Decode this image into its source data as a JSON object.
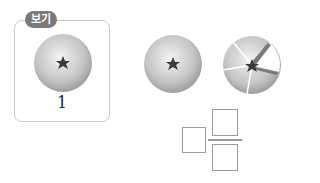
{
  "example": {
    "tag_label": "보기",
    "value_label": "1",
    "fruit": "whole-fruit"
  },
  "question": {
    "fruits": [
      {
        "name": "whole-fruit",
        "slices": 1,
        "missing": 0
      },
      {
        "name": "sliced-fruit",
        "slices": 5,
        "missing": 1
      }
    ],
    "answer": {
      "format": "mixed-number",
      "whole": "",
      "numerator": "",
      "denominator": ""
    }
  },
  "colors": {
    "fruit_light": "#e8e8e8",
    "fruit_dark": "#9a9a9a",
    "star": "#3a3a3a",
    "tag_bg": "#7a7a7a",
    "box_border": "#c9c9c9"
  }
}
